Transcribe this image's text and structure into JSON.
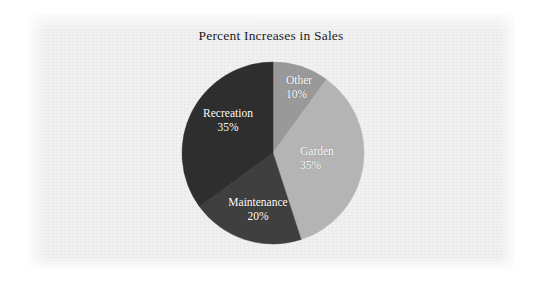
{
  "chart_data": {
    "type": "pie",
    "title": "Percent Increases in Sales",
    "xlabel": "",
    "ylabel": "",
    "legend": "none",
    "grid": false,
    "labels_inside_slices": true,
    "start_angle_clock": "12 o'clock",
    "direction": "clockwise",
    "categories": [
      "Other",
      "Garden",
      "Maintenance",
      "Recreation"
    ],
    "values": [
      10,
      35,
      20,
      35
    ],
    "value_suffix": "%",
    "total": 100,
    "slices": [
      {
        "name": "Other",
        "value": 10,
        "value_label": "10%",
        "color": "#999999",
        "angle_deg": 36,
        "start_deg": 0,
        "end_deg": 36
      },
      {
        "name": "Garden",
        "value": 35,
        "value_label": "35%",
        "color": "#b4b4b4",
        "angle_deg": 126,
        "start_deg": 36,
        "end_deg": 162
      },
      {
        "name": "Maintenance",
        "value": 20,
        "value_label": "20%",
        "color": "#3f3f3f",
        "angle_deg": 72,
        "start_deg": 162,
        "end_deg": 234
      },
      {
        "name": "Recreation",
        "value": 35,
        "value_label": "35%",
        "color": "#2e2e2e",
        "angle_deg": 126,
        "start_deg": 234,
        "end_deg": 360
      }
    ]
  },
  "page": {
    "background_color": "#ffffff",
    "panel_color": "#f1f1f1",
    "title_color": "#1d1d1d",
    "label_color": "#ffffff"
  }
}
